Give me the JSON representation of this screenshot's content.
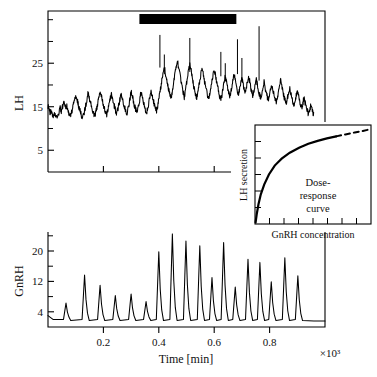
{
  "figure": {
    "title": "",
    "background": "#ffffff",
    "line_color": "#000000",
    "axis_color": "#000000"
  },
  "chart_data": [
    {
      "id": "lh-panel",
      "type": "line",
      "title": "",
      "xlabel": "",
      "ylabel": "LH",
      "xlim": [
        0,
        1000
      ],
      "ylim": [
        0,
        37
      ],
      "grid": false,
      "legend": null,
      "ytick_labels": [
        "5",
        "15",
        "25"
      ],
      "yticks": [
        5,
        15,
        25
      ],
      "yticks_minor": [
        10,
        20,
        30,
        35
      ],
      "xticks": [
        200,
        400,
        600,
        800
      ],
      "xtick_labels": [
        "",
        "",
        "",
        ""
      ],
      "annotations": [
        {
          "name": "gnrh-infusion-bar",
          "type": "horizontal-bar",
          "x_start": 330,
          "x_end": 680,
          "y": 36,
          "label": ""
        }
      ],
      "series": [
        {
          "name": "LH",
          "description": "Noisy pulsatile luteinizing-hormone time series; baseline oscillation around 15 rising to about 21 after onset of the bar, with spike error-bars.",
          "x": [
            0,
            4,
            8,
            12,
            16,
            20,
            24,
            28,
            32,
            36,
            40,
            44,
            48,
            52,
            56,
            60,
            64,
            68,
            72,
            76,
            80,
            84,
            88,
            92,
            96,
            100,
            104,
            108,
            112,
            116,
            120,
            124,
            128,
            132,
            136,
            140,
            144,
            148,
            152,
            156,
            160,
            164,
            168,
            172,
            176,
            180,
            184,
            188,
            192,
            196,
            200,
            204,
            208,
            212,
            216,
            220,
            224,
            228,
            232,
            236,
            240,
            244,
            248,
            252,
            256,
            260,
            264,
            268,
            272,
            276,
            280,
            284,
            288,
            292,
            296,
            300,
            304,
            308,
            312,
            316,
            320,
            324,
            328,
            332,
            336,
            340,
            344,
            348,
            352,
            356,
            360,
            364,
            368,
            372,
            376,
            380,
            384,
            388,
            392,
            396,
            400,
            404,
            408,
            412,
            416,
            420,
            424,
            428,
            432,
            436,
            440,
            444,
            448,
            452,
            456,
            460,
            464,
            468,
            472,
            476,
            480,
            484,
            488,
            492,
            496,
            500,
            504,
            508,
            512,
            516,
            520,
            524,
            528,
            532,
            536,
            540,
            544,
            548,
            552,
            556,
            560,
            564,
            568,
            572,
            576,
            580,
            584,
            588,
            592,
            596,
            600,
            604,
            608,
            612,
            616,
            620,
            624,
            628,
            632,
            636,
            640,
            644,
            648,
            652,
            656,
            660,
            664,
            668,
            672,
            676,
            680,
            684,
            688,
            692,
            696,
            700,
            704,
            708,
            712,
            716,
            720,
            724,
            728,
            732,
            736,
            740,
            744,
            748,
            752,
            756,
            760,
            764,
            768,
            772,
            776,
            780,
            784,
            788,
            792,
            796,
            800,
            804,
            808,
            812,
            816,
            820,
            824,
            828,
            832,
            836,
            840,
            844,
            848,
            852,
            856,
            860,
            864,
            868,
            872,
            876,
            880,
            884,
            888,
            892,
            896,
            900,
            904,
            908,
            912,
            916,
            920,
            924,
            928,
            932,
            936,
            940,
            944,
            948,
            952,
            956,
            960,
            964,
            968,
            972,
            976,
            980
          ],
          "y": [
            15.2,
            14.4,
            13.6,
            14.0,
            13.1,
            12.6,
            13.4,
            12.9,
            12.2,
            12.8,
            13.9,
            14.6,
            13.8,
            14.9,
            16.0,
            15.4,
            14.6,
            15.3,
            14.2,
            13.4,
            12.8,
            13.6,
            14.4,
            15.6,
            16.8,
            17.6,
            16.9,
            15.8,
            14.8,
            14.0,
            13.2,
            12.6,
            13.1,
            14.0,
            15.2,
            16.6,
            18.2,
            17.4,
            16.3,
            15.2,
            14.4,
            13.6,
            12.9,
            13.5,
            14.6,
            16.0,
            17.2,
            18.4,
            17.6,
            16.4,
            15.4,
            14.5,
            13.8,
            13.2,
            14.1,
            15.4,
            16.6,
            17.9,
            17.1,
            16.0,
            15.1,
            14.2,
            13.5,
            14.3,
            15.5,
            16.8,
            18.0,
            17.2,
            16.1,
            15.0,
            14.2,
            13.5,
            14.2,
            15.4,
            16.9,
            18.4,
            17.5,
            16.4,
            15.3,
            14.4,
            13.7,
            14.4,
            15.6,
            17.0,
            18.3,
            17.4,
            16.2,
            15.1,
            14.3,
            13.6,
            14.5,
            15.8,
            17.2,
            18.6,
            17.8,
            16.6,
            15.5,
            14.6,
            14.0,
            15.1,
            16.6,
            18.2,
            19.8,
            21.4,
            22.8,
            24.0,
            22.9,
            21.4,
            20.0,
            18.8,
            17.8,
            16.9,
            18.2,
            19.8,
            21.4,
            23.0,
            24.4,
            25.2,
            24.0,
            22.4,
            20.8,
            19.4,
            18.2,
            17.2,
            18.6,
            20.2,
            21.8,
            23.4,
            24.8,
            23.6,
            22.0,
            20.4,
            19.0,
            17.9,
            16.9,
            18.0,
            19.5,
            21.0,
            22.6,
            24.0,
            22.8,
            21.2,
            19.8,
            18.6,
            17.6,
            16.8,
            18.0,
            19.4,
            21.0,
            22.4,
            23.8,
            22.6,
            21.0,
            19.6,
            18.4,
            17.4,
            16.6,
            17.8,
            19.2,
            20.6,
            21.9,
            20.8,
            19.4,
            18.2,
            17.2,
            18.4,
            19.8,
            21.2,
            22.6,
            21.4,
            20.0,
            18.8,
            17.8,
            19.0,
            20.4,
            21.6,
            20.4,
            19.2,
            18.2,
            19.4,
            20.8,
            22.0,
            20.8,
            19.4,
            18.4,
            17.4,
            18.6,
            20.0,
            21.2,
            20.0,
            18.8,
            17.8,
            16.9,
            18.0,
            19.4,
            20.6,
            19.4,
            18.2,
            17.2,
            16.4,
            17.6,
            18.9,
            20.1,
            19.0,
            17.8,
            16.8,
            16.0,
            17.2,
            18.6,
            20.0,
            21.2,
            20.0,
            18.6,
            17.4,
            16.4,
            15.6,
            16.8,
            18.2,
            19.4,
            18.2,
            17.0,
            16.0,
            15.2,
            16.4,
            17.6,
            18.8,
            17.6,
            16.4,
            15.4,
            14.6,
            15.8,
            17.0,
            16.0,
            15.0,
            14.2,
            13.4,
            14.4,
            15.2,
            14.4,
            13.6,
            13.0
          ]
        }
      ],
      "error_bars": [
        {
          "x": 404,
          "ymin": 24.0,
          "ymax": 31.5
        },
        {
          "x": 420,
          "ymin": 22.5,
          "ymax": 27.0
        },
        {
          "x": 512,
          "ymin": 23.0,
          "ymax": 30.8
        },
        {
          "x": 624,
          "ymin": 22.0,
          "ymax": 27.6
        },
        {
          "x": 640,
          "ymin": 21.0,
          "ymax": 25.0
        },
        {
          "x": 684,
          "ymin": 22.5,
          "ymax": 30.5
        },
        {
          "x": 700,
          "ymin": 21.5,
          "ymax": 26.2
        },
        {
          "x": 762,
          "ymin": 21.0,
          "ymax": 33.5
        }
      ]
    },
    {
      "id": "gnrh-panel",
      "type": "line",
      "title": "",
      "xlabel": "Time [min]",
      "ylabel": "GnRH",
      "x_multiplier": "×10³",
      "xlim": [
        0,
        1000
      ],
      "ylim": [
        0,
        25
      ],
      "grid": false,
      "legend": null,
      "ytick_labels": [
        "4",
        "12",
        "20"
      ],
      "yticks": [
        4,
        12,
        20
      ],
      "yticks_minor": [
        8,
        16,
        24
      ],
      "xticks": [
        200,
        400,
        600,
        800
      ],
      "xtick_labels": [
        "0.2",
        "0.4",
        "0.6",
        "0.8"
      ],
      "series": [
        {
          "name": "GnRH",
          "description": "Sharp pulsatile GnRH secretion spikes on a low baseline (~2); amplitude grows through mid-record then declines.",
          "pulses": [
            {
              "t": 65,
              "amplitude": 6.3
            },
            {
              "t": 132,
              "amplitude": 13.7
            },
            {
              "t": 188,
              "amplitude": 11.0
            },
            {
              "t": 243,
              "amplitude": 8.3
            },
            {
              "t": 300,
              "amplitude": 8.7
            },
            {
              "t": 354,
              "amplitude": 6.7
            },
            {
              "t": 400,
              "amplitude": 19.8
            },
            {
              "t": 449,
              "amplitude": 24.5
            },
            {
              "t": 498,
              "amplitude": 22.6
            },
            {
              "t": 548,
              "amplitude": 21.4
            },
            {
              "t": 592,
              "amplitude": 13.0
            },
            {
              "t": 634,
              "amplitude": 22.2
            },
            {
              "t": 676,
              "amplitude": 10.5
            },
            {
              "t": 722,
              "amplitude": 17.8
            },
            {
              "t": 765,
              "amplitude": 17.0
            },
            {
              "t": 806,
              "amplitude": 11.9
            },
            {
              "t": 855,
              "amplitude": 18.2
            },
            {
              "t": 902,
              "amplitude": 13.5
            }
          ],
          "baseline": 2.0
        }
      ]
    },
    {
      "id": "inset-dose-response",
      "type": "line",
      "title": "Dose-response curve",
      "title_lines": [
        "Dose-",
        "response",
        "curve"
      ],
      "xlabel": "GnRH concentration",
      "ylabel": "LH secretion",
      "xlim": [
        0,
        10
      ],
      "ylim": [
        0,
        10
      ],
      "grid": false,
      "legend": null,
      "xtick_labels": [],
      "ytick_labels": [],
      "xticks_count": 7,
      "yticks_count": 5,
      "series": [
        {
          "name": "dose-response",
          "description": "Saturating (hyperbolic/Michaelis-Menten-like) curve, solid for the measured range and dashed for the extrapolated upper range.",
          "solid_x": [
            0.05,
            0.15,
            0.3,
            0.5,
            0.8,
            1.2,
            1.7,
            2.3,
            3.0,
            3.8,
            4.6,
            5.4,
            6.2,
            7.0
          ],
          "solid_y": [
            0.15,
            1.0,
            2.0,
            3.0,
            4.0,
            5.0,
            5.9,
            6.6,
            7.2,
            7.7,
            8.1,
            8.4,
            8.65,
            8.85
          ],
          "dashed_x": [
            7.0,
            7.8,
            8.6,
            9.3,
            9.85
          ],
          "dashed_y": [
            8.85,
            9.05,
            9.25,
            9.4,
            9.55
          ]
        }
      ]
    }
  ],
  "axes": {
    "lh": {
      "ylabel": "LH",
      "ticks": [
        "25",
        "15",
        "5"
      ]
    },
    "gnrh": {
      "ylabel": "GnRH",
      "ticks": [
        "20",
        "12",
        "4"
      ]
    },
    "time": {
      "label": "Time [min]",
      "ticks": [
        "0.2",
        "0.4",
        "0.6",
        "0.8"
      ],
      "multiplier": "×10³"
    },
    "inset": {
      "ylabel": "LH secretion",
      "xlabel": "GnRH concentration",
      "caption_lines": [
        "Dose-",
        "response",
        "curve"
      ]
    }
  }
}
